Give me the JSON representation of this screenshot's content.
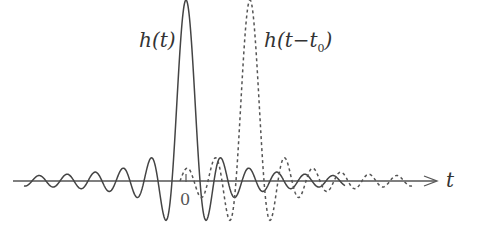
{
  "labels": {
    "h_t": "h(t)",
    "h_shift_main": "h(t−t",
    "h_shift_sub": "0",
    "h_shift_close": ")",
    "axis_t": "t",
    "origin": "0"
  },
  "chart_data": {
    "type": "line",
    "title": "",
    "xlabel": "t",
    "ylabel": "",
    "grid": false,
    "series": [
      {
        "name": "h(t)",
        "style": "solid",
        "center_px": 186,
        "peak_px_y": 0
      },
      {
        "name": "h(t - t0)",
        "style": "dashed",
        "center_px": 250,
        "peak_px_y": 2
      }
    ],
    "axis": {
      "y_px": 181,
      "x_start_px": 13,
      "x_end_px": 438
    },
    "origin_px": 186,
    "colors": {
      "line": "#444444",
      "axis": "#555555"
    }
  }
}
